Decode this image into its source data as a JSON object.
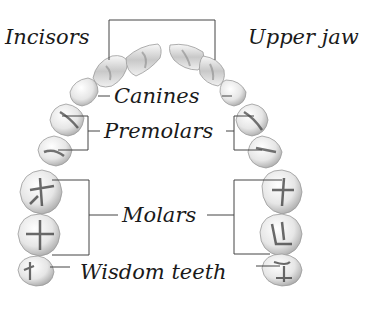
{
  "diagram": {
    "title": "Upper jaw",
    "labels": {
      "incisors": "Incisors",
      "upper_jaw": "Upper jaw",
      "canines": "Canines",
      "premolars": "Premolars",
      "molars": "Molars",
      "wisdom_teeth": "Wisdom teeth"
    },
    "colors": {
      "line": "#444444",
      "text": "#1a1a1a",
      "tooth_fill": "#f4f4f4",
      "tooth_shade": "#9a9a9a",
      "tooth_groove": "#3a3a3a"
    },
    "tooth_types": [
      "Incisors",
      "Canines",
      "Premolars",
      "Molars",
      "Wisdom teeth"
    ]
  }
}
